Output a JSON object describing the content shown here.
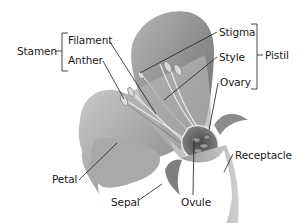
{
  "diagram": {
    "groups": [
      {
        "name": "Stamen",
        "parts": [
          "Filament",
          "Anther"
        ]
      },
      {
        "name": "Pistil",
        "parts": [
          "Stigma",
          "Style",
          "Ovary"
        ]
      }
    ],
    "labels": {
      "stamen": "Stamen",
      "filament": "Filament",
      "anther": "Anther",
      "stigma": "Stigma",
      "style": "Style",
      "ovary": "Ovary",
      "pistil": "Pistil",
      "receptacle": "Receptacle",
      "ovule": "Ovule",
      "sepal": "Sepal",
      "petal": "Petal"
    },
    "colors": {
      "line": "#1a1a1a",
      "petal_light": "#c8c8c8",
      "petal_mid": "#9a9a9a",
      "petal_dark": "#6a6a6a"
    }
  }
}
